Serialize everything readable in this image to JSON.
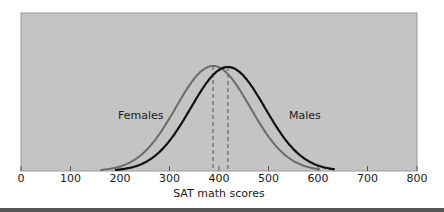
{
  "chart_data": {
    "type": "line",
    "title": "",
    "xlabel": "SAT math scores",
    "ylabel": "",
    "xlim": [
      0,
      800
    ],
    "x_ticks": [
      0,
      100,
      200,
      300,
      400,
      500,
      600,
      700,
      800
    ],
    "grid": false,
    "legend": "inline labels",
    "series": [
      {
        "name": "Females",
        "distribution": "normal",
        "mean": 388,
        "sd": 75,
        "range": [
          160,
          605
        ],
        "color": "#6b6b6b",
        "mean_marker": "dashed vertical line"
      },
      {
        "name": "Males",
        "distribution": "normal",
        "mean": 418,
        "sd": 75,
        "range": [
          190,
          635
        ],
        "color": "#111111",
        "mean_marker": "dashed vertical line"
      }
    ],
    "annotations": [
      "Females",
      "Males"
    ]
  },
  "colors": {
    "plot_background": "#c4c4c4",
    "females": "#6b6b6b",
    "males": "#111111"
  }
}
